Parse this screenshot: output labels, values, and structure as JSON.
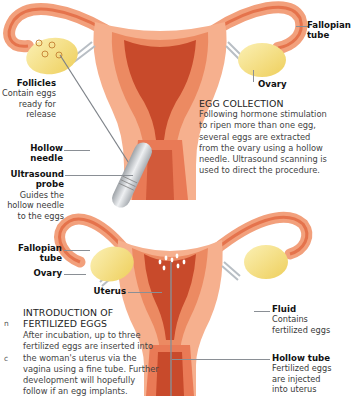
{
  "diagram": {
    "colors": {
      "uterus_outer": "#f6a784",
      "uterus_wall": "#e97a52",
      "uterus_lining": "#c9482a",
      "ovary": "#f3dd7c",
      "probe": "#c9ccd1",
      "leader_line": "#8a8f95"
    }
  },
  "top_panel": {
    "labels": {
      "fallopian_tube": {
        "title": "Fallopian tube",
        "line1": "Fallopian",
        "line2": "tube"
      },
      "ovary": {
        "title": "Ovary"
      },
      "follicles": {
        "title": "Follicles",
        "desc_lines": [
          "Contain eggs",
          "ready for",
          "release"
        ]
      },
      "hollow_needle": {
        "line1": "Hollow",
        "line2": "needle"
      },
      "ultrasound_probe": {
        "line1": "Ultrasound",
        "line2": "probe",
        "desc_lines": [
          "Guides the",
          "hollow needle",
          "to the eggs"
        ]
      }
    },
    "section": {
      "heading": "EGG COLLECTION",
      "body_lines": [
        "Following hormone stimulation",
        "to ripen more than one egg,",
        "several eggs are extracted",
        "from the ovary using a hollow",
        "needle. Ultrasound scanning is",
        "used to direct the procedure."
      ]
    }
  },
  "bottom_panel": {
    "labels": {
      "fallopian_tube": {
        "line1": "Fallopian",
        "line2": "tube"
      },
      "ovary": {
        "title": "Ovary"
      },
      "uterus": {
        "title": "Uterus"
      },
      "fluid": {
        "title": "Fluid",
        "desc_lines": [
          "Contains",
          "fertilized eggs"
        ]
      },
      "hollow_tube": {
        "title": "Hollow tube",
        "desc_lines": [
          "Fertilized eggs",
          "are injected",
          "into uterus"
        ]
      }
    },
    "section": {
      "heading_lines": [
        "INTRODUCTION OF",
        "FERTILIZED EGGS"
      ],
      "body_lines": [
        "After incubation, up to three",
        "fertilized eggs are inserted into",
        "the woman's uterus via the",
        "vagina using a fine tube. Further",
        "development will hopefully",
        "follow if an egg implants."
      ]
    },
    "edge_fragments": [
      "n",
      "c"
    ]
  }
}
